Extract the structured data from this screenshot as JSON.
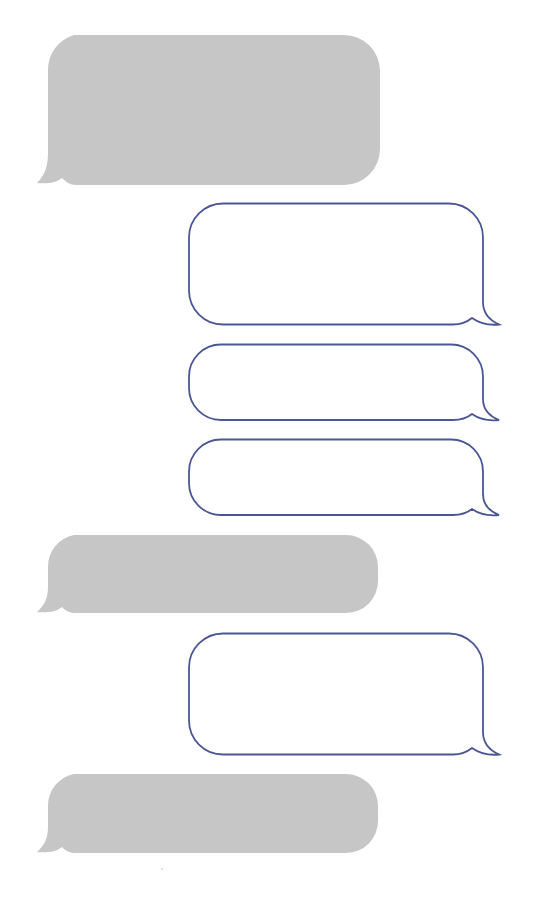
{
  "page": {
    "type": "blank chat bubble template",
    "background": "#ffffff"
  },
  "colors": {
    "incoming_fill": "#c6c6c6",
    "outgoing_stroke": "#4b5794",
    "outgoing_fill": "#ffffff"
  },
  "conversation": {
    "messages": [
      {
        "index": 0,
        "side": "incoming",
        "style": "filled-gray",
        "text": ""
      },
      {
        "index": 1,
        "side": "outgoing",
        "style": "outlined",
        "text": ""
      },
      {
        "index": 2,
        "side": "outgoing",
        "style": "outlined",
        "text": ""
      },
      {
        "index": 3,
        "side": "outgoing",
        "style": "outlined",
        "text": ""
      },
      {
        "index": 4,
        "side": "incoming",
        "style": "filled-gray",
        "text": ""
      },
      {
        "index": 5,
        "side": "outgoing",
        "style": "outlined",
        "text": ""
      },
      {
        "index": 6,
        "side": "incoming",
        "style": "filled-gray",
        "text": ""
      }
    ]
  }
}
